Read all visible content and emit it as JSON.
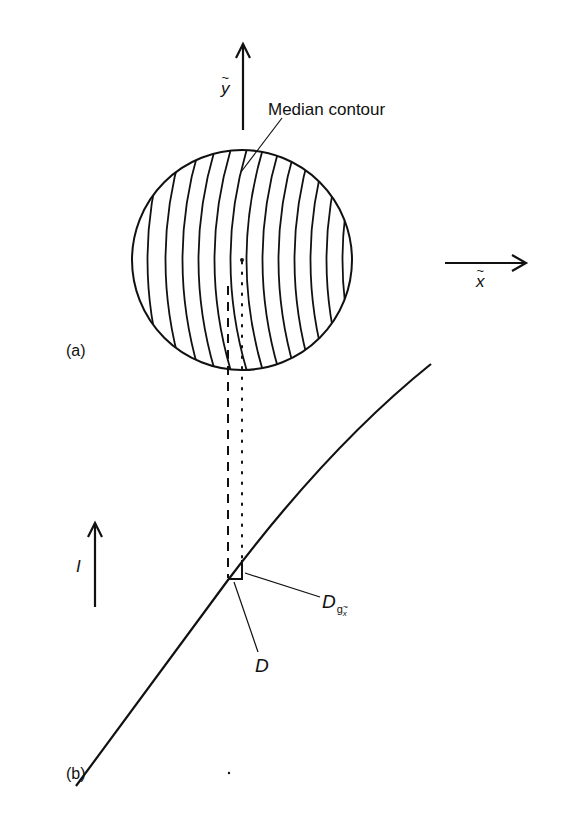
{
  "figure": {
    "panel_a": {
      "label": "(a)",
      "y_axis_label": "y",
      "x_axis_label": "x",
      "annotation": "Median contour",
      "circle": {
        "cx": 242,
        "cy": 260,
        "r": 110
      },
      "contour_count": 15
    },
    "panel_b": {
      "label": "(b)",
      "axis_label": "I",
      "point_D_label": "D",
      "point_Dg_label": "D",
      "point_Dg_sub": "g",
      "point_Dg_subsub": "x"
    },
    "colors": {
      "ink": "#111111",
      "background": "#ffffff"
    }
  }
}
